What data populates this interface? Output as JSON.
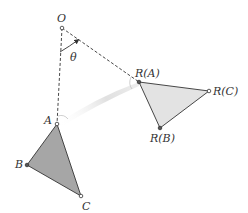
{
  "diagram": {
    "labels": {
      "center": "O",
      "angle": "θ",
      "a": "A",
      "b": "B",
      "c": "C",
      "ra": "R(A)",
      "rb": "R(B)",
      "rc": "R(C)"
    },
    "points": {
      "O": [
        62,
        28
      ],
      "A": [
        57,
        124
      ],
      "B": [
        27,
        165
      ],
      "C": [
        81,
        196
      ],
      "RA": [
        139,
        82
      ],
      "RB": [
        160,
        128
      ],
      "RC": [
        209,
        91
      ]
    },
    "colors": {
      "original_fill": "#a6a6a6",
      "rotated_fill": "#e3e3e3",
      "stroke": "#333333",
      "path_trace": "#e6e6e6"
    }
  }
}
